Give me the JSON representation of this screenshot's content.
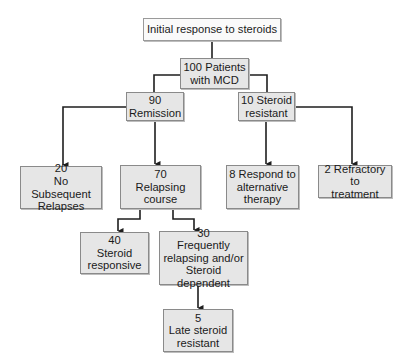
{
  "diagram": {
    "type": "flowchart",
    "line_color": "#1e1e1e",
    "box_fill": "#e6e6e6",
    "root_fill": "#fafafa",
    "nodes": [
      {
        "id": "root",
        "label": "Initial response to steroids"
      },
      {
        "id": "patients",
        "label": "100 Patients\nwith MCD"
      },
      {
        "id": "remission",
        "label": "90\nRemission"
      },
      {
        "id": "resistant",
        "label": "10 Steroid\nresistant"
      },
      {
        "id": "no_relapse",
        "label": "20\nNo Subsequent\nRelapses"
      },
      {
        "id": "relapsing",
        "label": "70\nRelapsing\ncourse"
      },
      {
        "id": "alt_therapy",
        "label": "8 Respond to\nalternative\ntherapy"
      },
      {
        "id": "refractory",
        "label": "2 Refractory to\ntreatment"
      },
      {
        "id": "responsive",
        "label": "40\nSteroid\nresponsive"
      },
      {
        "id": "frequent",
        "label": "30\nFrequently\nrelapsing and/or\nSteroid dependent"
      },
      {
        "id": "late_resistant",
        "label": "5\nLate steroid\nresistant"
      }
    ],
    "edges": [
      {
        "from": "root",
        "to": "patients",
        "arrow": false
      },
      {
        "from": "patients",
        "to": "remission",
        "arrow": false
      },
      {
        "from": "patients",
        "to": "resistant",
        "arrow": false
      },
      {
        "from": "remission",
        "to": "no_relapse",
        "arrow": true
      },
      {
        "from": "remission",
        "to": "relapsing",
        "arrow": true
      },
      {
        "from": "resistant",
        "to": "alt_therapy",
        "arrow": true
      },
      {
        "from": "resistant",
        "to": "refractory",
        "arrow": true
      },
      {
        "from": "relapsing",
        "to": "responsive",
        "arrow": true
      },
      {
        "from": "relapsing",
        "to": "frequent",
        "arrow": true
      },
      {
        "from": "frequent",
        "to": "late_resistant",
        "arrow": true
      }
    ]
  }
}
